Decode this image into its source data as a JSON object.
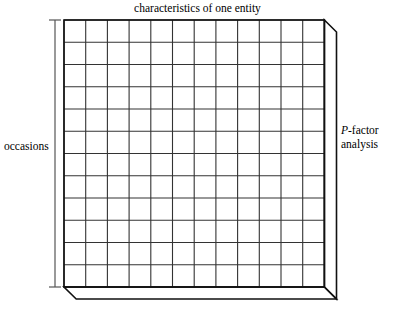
{
  "figure": {
    "type": "3d-data-box-diagram",
    "title": "characteristics of one entity",
    "left_axis_label": "occasions",
    "right_label_line1_italic": "P",
    "right_label_line1_rest": "-factor",
    "right_label_line2": "analysis",
    "grid": {
      "columns": 12,
      "rows": 12,
      "cells_total": 144
    },
    "colors": {
      "background": "#ffffff",
      "stroke": "#1a1a1a",
      "grid_stroke": "#333333",
      "bracket_stroke": "#555555"
    }
  }
}
